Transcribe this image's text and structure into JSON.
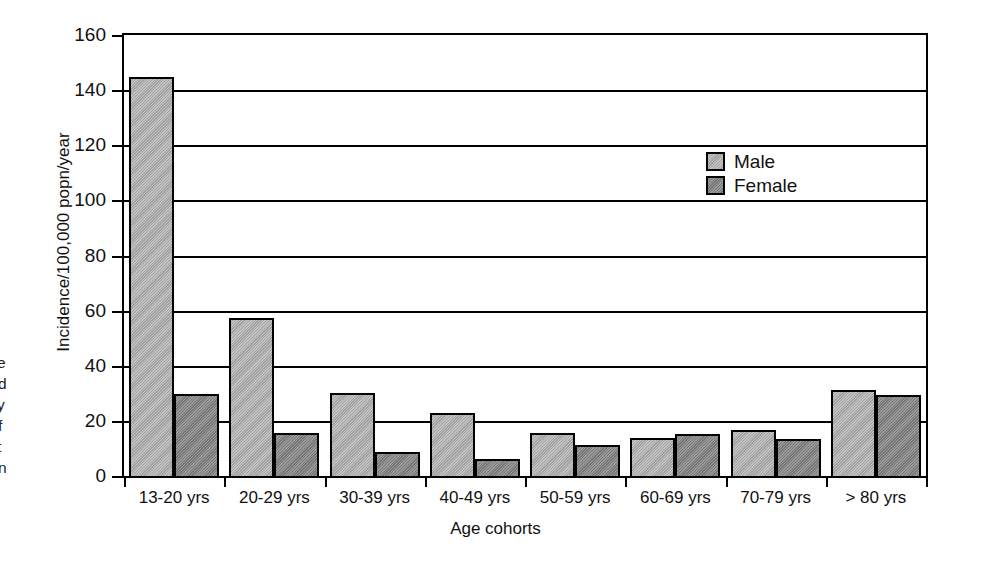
{
  "chart_data": {
    "type": "bar",
    "title": "",
    "xlabel": "Age cohorts",
    "ylabel": "Incidence/100,000 popn/year",
    "ylim": [
      0,
      160
    ],
    "ytick_values": [
      0,
      20,
      40,
      60,
      80,
      100,
      120,
      140,
      160
    ],
    "ytick_labels": [
      "0",
      "20",
      "40",
      "60",
      "80",
      "100",
      "120",
      "140",
      "160"
    ],
    "grid": true,
    "grid_axis": "y",
    "legend_position": "inside-upper-right",
    "categories": [
      "13-20 yrs",
      "20-29 yrs",
      "30-39 yrs",
      "40-49 yrs",
      "50-59 yrs",
      "60-69 yrs",
      "70-79 yrs",
      "> 80 yrs"
    ],
    "series": [
      {
        "name": "Male",
        "color": "#a9a9a9",
        "values": [
          145.5,
          58.0,
          31.0,
          23.5,
          16.5,
          14.5,
          17.5,
          32.0
        ]
      },
      {
        "name": "Female",
        "color": "#7f7f7f",
        "values": [
          30.5,
          16.5,
          9.5,
          7.0,
          12.0,
          16.0,
          14.0,
          30.0
        ]
      }
    ]
  },
  "legend": {
    "entries": [
      {
        "label": "Male",
        "swatch": "male-swatch"
      },
      {
        "label": "Female",
        "swatch": "female-swatch"
      }
    ]
  },
  "caption_fragment": {
    "lines": [
      "e",
      "d",
      "y",
      "f",
      "t",
      "n"
    ]
  }
}
